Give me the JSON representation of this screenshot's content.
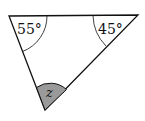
{
  "diagram": {
    "type": "triangle-angles",
    "angles": [
      {
        "vertex": "top-left",
        "label": "55°"
      },
      {
        "vertex": "top-right",
        "label": "45°"
      },
      {
        "vertex": "bottom",
        "label": "z",
        "shaded": true
      }
    ],
    "colors": {
      "stroke": "#111111",
      "shade": "#9a9a9a",
      "background": "#ffffff"
    }
  }
}
